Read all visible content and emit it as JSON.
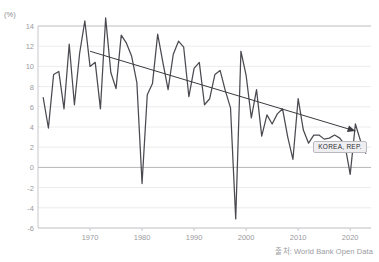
{
  "unit_label": "(%)",
  "cropped_title": "",
  "source_text": "출처: World Bank Open Data",
  "annotation": {
    "series_label": "KOREA, REP."
  },
  "colors": {
    "line": "#4a4a50",
    "trend": "#3a3a40",
    "grid": "#ececee",
    "zero_line": "#b5b5ba",
    "axis": "#c8c8cc",
    "tick_text": "#9a9aa0",
    "label_box_bg": "#efeff1",
    "label_box_border": "#b9b9bf",
    "label_box_text": "#2e2e33"
  },
  "chart_data": {
    "type": "line",
    "title": "",
    "subtitle": "",
    "xlabel": "",
    "ylabel": "(%)",
    "grid": true,
    "legend": "inline-label",
    "xlim": [
      1960,
      2024
    ],
    "ylim": [
      -6,
      14
    ],
    "ytick_labels": [
      "14",
      "12",
      "10",
      "8",
      "6",
      "4",
      "2",
      "0",
      "-2",
      "-4",
      "-6"
    ],
    "yticks": [
      14,
      12,
      10,
      8,
      6,
      4,
      2,
      0,
      -2,
      -4,
      -6
    ],
    "xtick_labels": [
      "1970",
      "1980",
      "1990",
      "2000",
      "2010",
      "2020"
    ],
    "xticks": [
      1970,
      1980,
      1990,
      2000,
      2010,
      2020
    ],
    "series": [
      {
        "name": "KOREA, REP.",
        "x": [
          1961,
          1962,
          1963,
          1964,
          1965,
          1966,
          1967,
          1968,
          1969,
          1970,
          1971,
          1972,
          1973,
          1974,
          1975,
          1976,
          1977,
          1978,
          1979,
          1980,
          1981,
          1982,
          1983,
          1984,
          1985,
          1986,
          1987,
          1988,
          1989,
          1990,
          1991,
          1992,
          1993,
          1994,
          1995,
          1996,
          1997,
          1998,
          1999,
          2000,
          2001,
          2002,
          2003,
          2004,
          2005,
          2006,
          2007,
          2008,
          2009,
          2010,
          2011,
          2012,
          2013,
          2014,
          2015,
          2016,
          2017,
          2018,
          2019,
          2020,
          2021,
          2022,
          2023
        ],
        "values": [
          6.9,
          3.9,
          9.2,
          9.5,
          5.8,
          12.2,
          6.2,
          11.3,
          14.5,
          10.0,
          10.4,
          5.8,
          14.8,
          9.4,
          7.8,
          13.1,
          12.3,
          11.0,
          8.4,
          -1.6,
          7.2,
          8.3,
          13.2,
          10.4,
          7.7,
          11.2,
          12.5,
          11.9,
          7.0,
          9.8,
          10.4,
          6.2,
          6.8,
          9.2,
          9.6,
          7.6,
          5.9,
          -5.1,
          11.5,
          9.1,
          4.9,
          7.7,
          3.1,
          5.2,
          4.3,
          5.3,
          5.8,
          3.0,
          0.8,
          6.8,
          3.7,
          2.4,
          3.2,
          3.2,
          2.8,
          2.9,
          3.2,
          2.9,
          2.2,
          -0.7,
          4.3,
          2.6,
          1.4
        ]
      }
    ],
    "trend_line": {
      "name": "declining-trend-arrow",
      "x_start": 1970,
      "y_start": 11.5,
      "x_end": 2021,
      "y_end": 3.6,
      "arrow": true
    },
    "annotations": [
      {
        "text": "KOREA, REP.",
        "x": 2018,
        "y": 2.0
      }
    ]
  }
}
